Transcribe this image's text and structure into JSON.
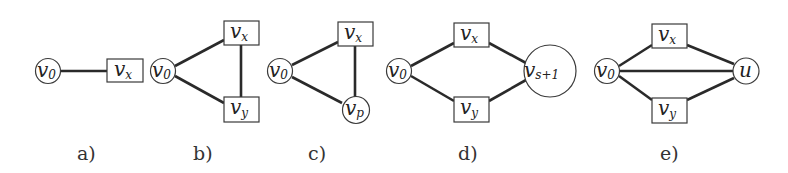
{
  "figure": {
    "panels": [
      {
        "id": "a",
        "caption": "a)",
        "nodes": [
          {
            "id": "v0",
            "base": "v",
            "sub": "0",
            "shape": "circle"
          },
          {
            "id": "vx",
            "base": "v",
            "sub": "x",
            "shape": "box"
          }
        ],
        "edges": [
          [
            "v0",
            "vx"
          ]
        ]
      },
      {
        "id": "b",
        "caption": "b)",
        "nodes": [
          {
            "id": "v0",
            "base": "v",
            "sub": "0",
            "shape": "circle"
          },
          {
            "id": "vx",
            "base": "v",
            "sub": "x",
            "shape": "box"
          },
          {
            "id": "vy",
            "base": "v",
            "sub": "y",
            "shape": "box"
          }
        ],
        "edges": [
          [
            "v0",
            "vx"
          ],
          [
            "v0",
            "vy"
          ],
          [
            "vx",
            "vy"
          ]
        ]
      },
      {
        "id": "c",
        "caption": "c)",
        "nodes": [
          {
            "id": "v0",
            "base": "v",
            "sub": "0",
            "shape": "circle"
          },
          {
            "id": "vx",
            "base": "v",
            "sub": "x",
            "shape": "box"
          },
          {
            "id": "vp",
            "base": "v",
            "sub": "p",
            "shape": "circle"
          }
        ],
        "edges": [
          [
            "v0",
            "vx"
          ],
          [
            "v0",
            "vp"
          ],
          [
            "vx",
            "vp"
          ]
        ]
      },
      {
        "id": "d",
        "caption": "d)",
        "nodes": [
          {
            "id": "v0",
            "base": "v",
            "sub": "0",
            "shape": "circle"
          },
          {
            "id": "vx",
            "base": "v",
            "sub": "x",
            "shape": "box"
          },
          {
            "id": "vy",
            "base": "v",
            "sub": "y",
            "shape": "box"
          },
          {
            "id": "vs1",
            "base": "v",
            "sub": "s+1",
            "shape": "circle"
          }
        ],
        "edges": [
          [
            "v0",
            "vx"
          ],
          [
            "v0",
            "vy"
          ],
          [
            "vx",
            "vs1"
          ],
          [
            "vy",
            "vs1"
          ]
        ]
      },
      {
        "id": "e",
        "caption": "e)",
        "nodes": [
          {
            "id": "v0",
            "base": "v",
            "sub": "0",
            "shape": "circle"
          },
          {
            "id": "vx",
            "base": "v",
            "sub": "x",
            "shape": "box"
          },
          {
            "id": "vy",
            "base": "v",
            "sub": "y",
            "shape": "box"
          },
          {
            "id": "u",
            "base": "u",
            "sub": "",
            "shape": "circle"
          }
        ],
        "edges": [
          [
            "v0",
            "vx"
          ],
          [
            "v0",
            "vy"
          ],
          [
            "v0",
            "u"
          ],
          [
            "vx",
            "u"
          ],
          [
            "vy",
            "u"
          ]
        ]
      }
    ]
  }
}
